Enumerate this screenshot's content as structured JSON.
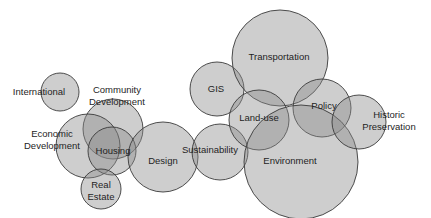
{
  "diagram": {
    "type": "bubble-overlap",
    "fill_color": "#8a8a8a",
    "stroke_color": "#3a3a3a",
    "background": "#ffffff",
    "bubbles": [
      {
        "id": "international",
        "lines": [
          "International"
        ],
        "cx": 60,
        "cy": 92,
        "r": 19,
        "lx": 39,
        "ly": 92
      },
      {
        "id": "community-development",
        "lines": [
          "Community",
          "Development"
        ],
        "cx": 113,
        "cy": 129,
        "r": 30,
        "lx": 117,
        "ly": 96
      },
      {
        "id": "economic-development",
        "lines": [
          "Economic",
          "Development"
        ],
        "cx": 88,
        "cy": 146,
        "r": 32,
        "lx": 52,
        "ly": 140
      },
      {
        "id": "housing",
        "lines": [
          "Housing"
        ],
        "cx": 112,
        "cy": 151,
        "r": 24,
        "lx": 113,
        "ly": 151
      },
      {
        "id": "real-estate",
        "lines": [
          "Real",
          "Estate"
        ],
        "cx": 101,
        "cy": 189,
        "r": 20,
        "lx": 101,
        "ly": 191
      },
      {
        "id": "design",
        "lines": [
          "Design"
        ],
        "cx": 163,
        "cy": 157,
        "r": 35,
        "lx": 163,
        "ly": 161
      },
      {
        "id": "sustainability",
        "lines": [
          "Sustainability"
        ],
        "cx": 220,
        "cy": 152,
        "r": 28,
        "lx": 210,
        "ly": 150
      },
      {
        "id": "gis",
        "lines": [
          "GIS"
        ],
        "cx": 217,
        "cy": 89,
        "r": 27,
        "lx": 216,
        "ly": 89
      },
      {
        "id": "transportation",
        "lines": [
          "Transportation"
        ],
        "cx": 280,
        "cy": 58,
        "r": 48,
        "lx": 279,
        "ly": 57
      },
      {
        "id": "land-use",
        "lines": [
          "Land-use"
        ],
        "cx": 259,
        "cy": 120,
        "r": 30,
        "lx": 259,
        "ly": 118
      },
      {
        "id": "policy",
        "lines": [
          "Policy"
        ],
        "cx": 322,
        "cy": 108,
        "r": 29,
        "lx": 324,
        "ly": 106
      },
      {
        "id": "environment",
        "lines": [
          "Environment"
        ],
        "cx": 301,
        "cy": 162,
        "r": 57,
        "lx": 290,
        "ly": 161
      },
      {
        "id": "historic-preservation",
        "lines": [
          "Historic",
          "Preservation"
        ],
        "cx": 359,
        "cy": 122,
        "r": 27,
        "lx": 389,
        "ly": 121
      }
    ]
  }
}
